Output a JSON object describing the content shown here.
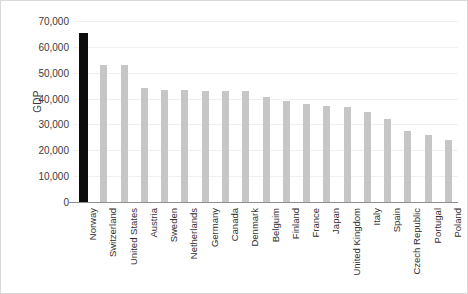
{
  "chart_data": {
    "type": "bar",
    "title": "",
    "xlabel": "",
    "ylabel": "GDP",
    "ylim": [
      0,
      70000
    ],
    "ytick_values": [
      0,
      10000,
      20000,
      30000,
      40000,
      50000,
      60000,
      70000
    ],
    "ytick_labels": [
      "0",
      "10,000",
      "20,000",
      "30,000",
      "40,000",
      "50,000",
      "60,000",
      "70,000"
    ],
    "grid": true,
    "legend": "none",
    "highlight_category": "Norway",
    "colors": {
      "bar": "#c6c6c6",
      "highlight_bar": "#0c0c0c",
      "grid": "#f0f0f0",
      "axis": "#8d8d8d",
      "text": "#3a3a3a"
    },
    "categories": [
      "Norway",
      "Switzerland",
      "United States",
      "Austria",
      "Sweden",
      "Netherlands",
      "Germany",
      "Canada",
      "Denmark",
      "Belguim",
      "Finland",
      "France",
      "Japan",
      "United Kingdom",
      "Italy",
      "Spain",
      "Czech Republic",
      "Portugal",
      "Poland"
    ],
    "values": [
      65500,
      53000,
      52800,
      44000,
      43500,
      43200,
      43000,
      43000,
      42800,
      40500,
      39000,
      38000,
      37000,
      36800,
      35000,
      32000,
      27500,
      26000,
      24000
    ]
  }
}
